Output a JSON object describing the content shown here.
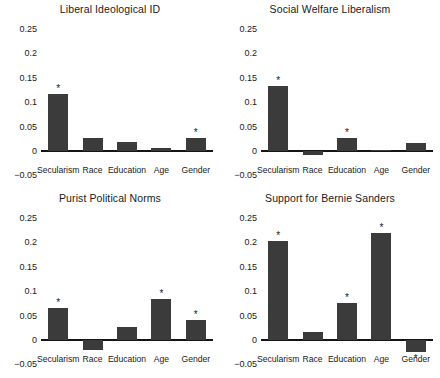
{
  "figure": {
    "bar_color": "#3b3b3b",
    "axis_color": "#151515",
    "significance_marker": "*"
  },
  "yticks": [
    "0.25",
    "0.2",
    "0.15",
    "0.1",
    "0.05",
    "0",
    "-0.05"
  ],
  "ytick_values": [
    0.25,
    0.2,
    0.15,
    0.1,
    0.05,
    0,
    -0.05
  ],
  "categories": [
    "Secularism",
    "Race",
    "Education",
    "Age",
    "Gender"
  ],
  "chart_data": [
    {
      "type": "bar",
      "title": "Liberal Ideological ID",
      "categories": [
        "Secularism",
        "Race",
        "Education",
        "Age",
        "Gender"
      ],
      "values": [
        0.116,
        0.026,
        0.019,
        0.007,
        0.026
      ],
      "significant": [
        true,
        false,
        false,
        false,
        true
      ],
      "xlabel": "",
      "ylabel": "",
      "ylim": [
        -0.05,
        0.25
      ],
      "grid": false,
      "legend": "none"
    },
    {
      "type": "bar",
      "title": "Social Welfare Liberalism",
      "categories": [
        "Secularism",
        "Race",
        "Education",
        "Age",
        "Gender"
      ],
      "values": [
        0.134,
        -0.008,
        0.026,
        0.003,
        0.016
      ],
      "significant": [
        true,
        false,
        true,
        false,
        false
      ],
      "xlabel": "",
      "ylabel": "",
      "ylim": [
        -0.05,
        0.25
      ],
      "grid": false,
      "legend": "none"
    },
    {
      "type": "bar",
      "title": "Purist Political Norms",
      "categories": [
        "Secularism",
        "Race",
        "Education",
        "Age",
        "Gender"
      ],
      "values": [
        0.066,
        -0.02,
        0.026,
        0.084,
        0.042
      ],
      "significant": [
        true,
        false,
        false,
        true,
        true
      ],
      "xlabel": "",
      "ylabel": "",
      "ylim": [
        -0.05,
        0.25
      ],
      "grid": false,
      "legend": "none"
    },
    {
      "type": "bar",
      "title": "Support for Bernie Sanders",
      "categories": [
        "Secularism",
        "Race",
        "Education",
        "Age",
        "Gender"
      ],
      "values": [
        0.202,
        0.017,
        0.075,
        0.22,
        -0.025
      ],
      "significant": [
        true,
        false,
        true,
        true,
        true
      ],
      "xlabel": "",
      "ylabel": "",
      "ylim": [
        -0.05,
        0.25
      ],
      "grid": false,
      "legend": "none"
    }
  ]
}
